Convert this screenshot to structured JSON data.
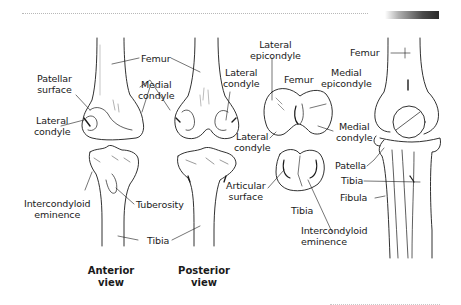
{
  "decorations": {
    "top_rule": "dotted",
    "top_bar_gradient": [
      "#ffffff",
      "#2a2a2a"
    ],
    "bottom_rule": "dotted"
  },
  "labels": {
    "femur_anterior_posterior": "Femur",
    "patellar_surface": [
      "Patellar",
      "surface"
    ],
    "medial_condyle_1": [
      "Medial",
      "condyle"
    ],
    "lateral_condyle_1": [
      "Lateral",
      "condyle"
    ],
    "lateral_condyle_2": [
      "Lateral",
      "condyle"
    ],
    "lateral_epicondyle": [
      "Lateral",
      "epicondyle"
    ],
    "femur_inferior": "Femur",
    "medial_epicondyle": [
      "Medial",
      "epicondyle"
    ],
    "lateral_condyle_3": [
      "Lateral",
      "condyle"
    ],
    "medial_condyle_2": [
      "Medial",
      "condyle"
    ],
    "femur_lateral": "Femur",
    "patella": "Patella",
    "tibia_lateral": "Tibia",
    "fibula": "Fibula",
    "intercondyloid_eminence_1": [
      "Intercondyloid",
      "eminence"
    ],
    "tuberosity": "Tuberosity",
    "tibia_anterior_posterior": "Tibia",
    "articular_surface": [
      "Articular",
      "surface"
    ],
    "tibia_superior": "Tibia",
    "intercondyloid_eminence_2": [
      "Intercondyloid",
      "eminence"
    ]
  },
  "captions": {
    "anterior": [
      "Anterior",
      "view"
    ],
    "posterior": [
      "Posterior",
      "view"
    ]
  }
}
